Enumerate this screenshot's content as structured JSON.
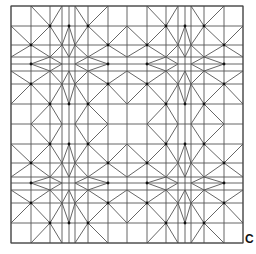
{
  "figure": {
    "label": "C",
    "grid": {
      "xs": [
        11,
        31,
        50,
        62,
        69,
        75,
        88,
        108,
        127,
        147,
        166,
        178,
        185,
        191,
        204,
        224,
        243
      ],
      "ys": [
        6,
        26,
        45,
        57,
        64,
        71,
        84,
        104,
        124,
        144,
        163,
        177,
        183,
        190,
        203,
        223,
        243
      ]
    },
    "tiles": {
      "cols": 2,
      "rows": 2
    },
    "colors": {
      "line": "#555555",
      "dot": "#111111",
      "border": "#444444"
    },
    "tile_lines": [
      [
        [
          1,
          0
        ],
        [
          2,
          1
        ]
      ],
      [
        [
          3,
          0
        ],
        [
          2,
          1
        ]
      ],
      [
        [
          2,
          1
        ],
        [
          1,
          2
        ]
      ],
      [
        [
          2,
          1
        ],
        [
          3,
          2
        ]
      ],
      [
        [
          5,
          0
        ],
        [
          6,
          1
        ]
      ],
      [
        [
          7,
          0
        ],
        [
          6,
          1
        ]
      ],
      [
        [
          6,
          1
        ],
        [
          5,
          2
        ]
      ],
      [
        [
          6,
          1
        ],
        [
          7,
          2
        ]
      ],
      [
        [
          0,
          1
        ],
        [
          1,
          2
        ]
      ],
      [
        [
          0,
          3
        ],
        [
          1,
          2
        ]
      ],
      [
        [
          1,
          2
        ],
        [
          2,
          3
        ]
      ],
      [
        [
          8,
          1
        ],
        [
          7,
          2
        ]
      ],
      [
        [
          8,
          3
        ],
        [
          7,
          2
        ]
      ],
      [
        [
          7,
          2
        ],
        [
          6,
          3
        ]
      ],
      [
        [
          0,
          5
        ],
        [
          1,
          6
        ]
      ],
      [
        [
          0,
          7
        ],
        [
          1,
          6
        ]
      ],
      [
        [
          1,
          6
        ],
        [
          2,
          5
        ]
      ],
      [
        [
          8,
          5
        ],
        [
          7,
          6
        ]
      ],
      [
        [
          8,
          7
        ],
        [
          7,
          6
        ]
      ],
      [
        [
          7,
          6
        ],
        [
          6,
          5
        ]
      ],
      [
        [
          1,
          8
        ],
        [
          2,
          7
        ]
      ],
      [
        [
          3,
          8
        ],
        [
          2,
          7
        ]
      ],
      [
        [
          2,
          7
        ],
        [
          1,
          6
        ]
      ],
      [
        [
          2,
          7
        ],
        [
          3,
          6
        ]
      ],
      [
        [
          5,
          8
        ],
        [
          6,
          7
        ]
      ],
      [
        [
          7,
          8
        ],
        [
          6,
          7
        ]
      ],
      [
        [
          6,
          7
        ],
        [
          5,
          6
        ]
      ],
      [
        [
          6,
          7
        ],
        [
          7,
          6
        ]
      ],
      [
        [
          4,
          1
        ],
        [
          3,
          2
        ]
      ],
      [
        [
          4,
          1
        ],
        [
          5,
          2
        ]
      ],
      [
        [
          3,
          2
        ],
        [
          4,
          3
        ]
      ],
      [
        [
          5,
          2
        ],
        [
          4,
          3
        ]
      ],
      [
        [
          4,
          5
        ],
        [
          3,
          6
        ]
      ],
      [
        [
          4,
          5
        ],
        [
          5,
          6
        ]
      ],
      [
        [
          3,
          6
        ],
        [
          4,
          7
        ]
      ],
      [
        [
          5,
          6
        ],
        [
          4,
          7
        ]
      ],
      [
        [
          1,
          4
        ],
        [
          2,
          3
        ]
      ],
      [
        [
          1,
          4
        ],
        [
          2,
          5
        ]
      ],
      [
        [
          2,
          3
        ],
        [
          3,
          4
        ]
      ],
      [
        [
          2,
          5
        ],
        [
          3,
          4
        ]
      ],
      [
        [
          5,
          4
        ],
        [
          6,
          3
        ]
      ],
      [
        [
          5,
          4
        ],
        [
          6,
          5
        ]
      ],
      [
        [
          6,
          3
        ],
        [
          7,
          4
        ]
      ],
      [
        [
          6,
          5
        ],
        [
          7,
          4
        ]
      ],
      [
        [
          2,
          5
        ],
        [
          3,
          6
        ]
      ],
      [
        [
          6,
          5
        ],
        [
          5,
          6
        ]
      ],
      [
        [
          3,
          2
        ],
        [
          2,
          3
        ]
      ],
      [
        [
          5,
          2
        ],
        [
          6,
          3
        ]
      ]
    ],
    "tile_dots": [
      [
        2,
        1
      ],
      [
        6,
        1
      ],
      [
        1,
        2
      ],
      [
        7,
        2
      ],
      [
        1,
        6
      ],
      [
        7,
        6
      ],
      [
        2,
        7
      ],
      [
        6,
        7
      ],
      [
        4,
        1
      ],
      [
        4,
        7
      ],
      [
        1,
        4
      ],
      [
        7,
        4
      ]
    ]
  }
}
